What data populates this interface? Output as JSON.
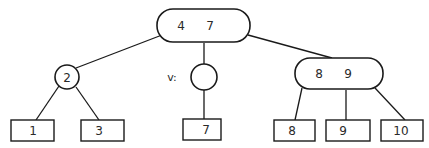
{
  "diagram": {
    "type": "2-3 tree",
    "root": {
      "id": "root",
      "keys": [
        "4",
        "7"
      ],
      "label_a": "4",
      "label_b": "7"
    },
    "internal": [
      {
        "id": "n2",
        "keys": [
          "2"
        ],
        "label": "2"
      },
      {
        "id": "v",
        "keys": [],
        "name_label": "v:"
      },
      {
        "id": "n89",
        "keys": [
          "8",
          "9"
        ],
        "label_a": "8",
        "label_b": "9"
      }
    ],
    "leaves": [
      {
        "id": "leaf1",
        "label": "1",
        "parent": "n2"
      },
      {
        "id": "leaf3",
        "label": "3",
        "parent": "n2"
      },
      {
        "id": "leaf7",
        "label": "7",
        "parent": "v"
      },
      {
        "id": "leaf8",
        "label": "8",
        "parent": "n89"
      },
      {
        "id": "leaf9",
        "label": "9",
        "parent": "n89"
      },
      {
        "id": "leaf10",
        "label": "10",
        "parent": "n89"
      }
    ],
    "edges": [
      [
        "root",
        "n2"
      ],
      [
        "root",
        "v"
      ],
      [
        "root",
        "n89"
      ],
      [
        "n2",
        "leaf1"
      ],
      [
        "n2",
        "leaf3"
      ],
      [
        "v",
        "leaf7"
      ],
      [
        "n89",
        "leaf8"
      ],
      [
        "n89",
        "leaf9"
      ],
      [
        "n89",
        "leaf10"
      ]
    ]
  }
}
